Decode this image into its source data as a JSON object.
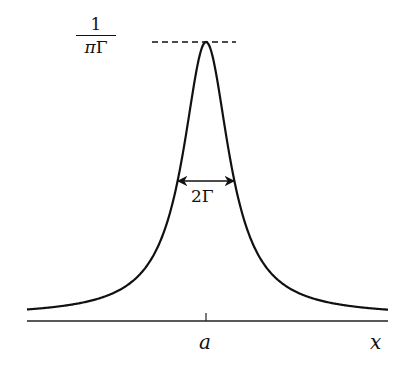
{
  "diagram": {
    "type": "lorentzian-peak",
    "peak_label": {
      "numerator": "1",
      "denominator_pi": "π",
      "denominator_gamma": "Γ"
    },
    "width_label": "2Γ",
    "center_label": "a",
    "axis_label": "x",
    "colors": {
      "curve": "#111111",
      "axis": "#222222",
      "background": "#ffffff"
    }
  }
}
